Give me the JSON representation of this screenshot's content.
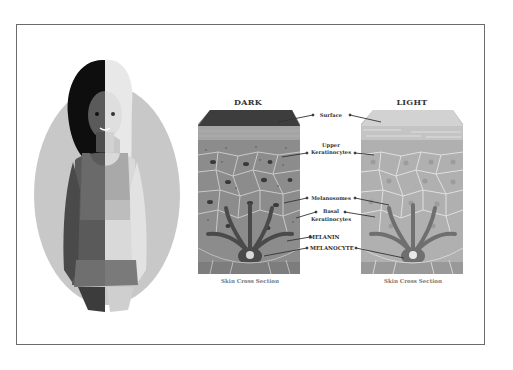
{
  "figure": {
    "illustration": "half-dark half-light skin woman in gray oval",
    "colors": {
      "frame_border": "#6b6b6b",
      "oval": "#c8c8c8",
      "dark_hair": "#0e0e0e",
      "light_hair": "#e6e6e6",
      "dark_skin": "#5a5a5a",
      "light_skin": "#d9d9d9",
      "top_dark": "#6a6a6a",
      "top_light": "#a9a9a9",
      "skirt": "#6f6f6f",
      "legs_dark": "#3c3c3c",
      "legs_light": "#cfcfcf"
    }
  },
  "panels": {
    "dark": {
      "title": "DARK",
      "caption": "Skin Cross Section"
    },
    "light": {
      "title": "LIGHT",
      "caption": "Skin Cross Section"
    }
  },
  "labels": {
    "surface": "Surface",
    "upper_line1": "Upper",
    "upper_line2": "Keratinocytes",
    "melanosomes": "Melanosomes",
    "basal_line1": "Basal",
    "basal_line2": "Keratinocytes",
    "melanin": "MELANIN",
    "melanocyte": "MELANOCYTE"
  }
}
